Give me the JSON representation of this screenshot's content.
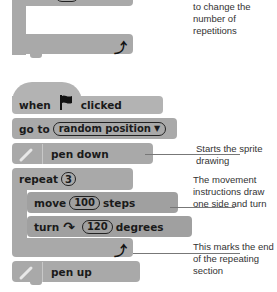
{
  "top_fragment": {
    "repeat_label": "repeat",
    "repeat_value": "10"
  },
  "top_annotation": "to change the number of repetitions",
  "script": {
    "hat": {
      "when": "when",
      "flag_icon": "green-flag-icon",
      "clicked": "clicked"
    },
    "go_to": {
      "label": "go to",
      "dropdown": "random position"
    },
    "pen_down": {
      "label": "pen down",
      "icon": "pen-icon"
    },
    "repeat": {
      "label": "repeat",
      "value": "3"
    },
    "move": {
      "label": "move",
      "value": "100",
      "unit": "steps"
    },
    "turn": {
      "label": "turn",
      "icon": "rotate-clockwise-icon",
      "value": "120",
      "unit": "degrees"
    },
    "loop_end_icon": "loop-arrow-icon",
    "pen_up": {
      "label": "pen up",
      "icon": "pen-icon"
    }
  },
  "annotations": {
    "pen_down": "Starts the sprite drawing",
    "movement": "The movement instructions draw one side and turn",
    "loop_end": "This marks the end of the repeating section"
  },
  "colors": {
    "block": "#a9a9a9",
    "background": "#ffffff",
    "text": "#1a1a1a",
    "annotation_text": "#333333"
  }
}
